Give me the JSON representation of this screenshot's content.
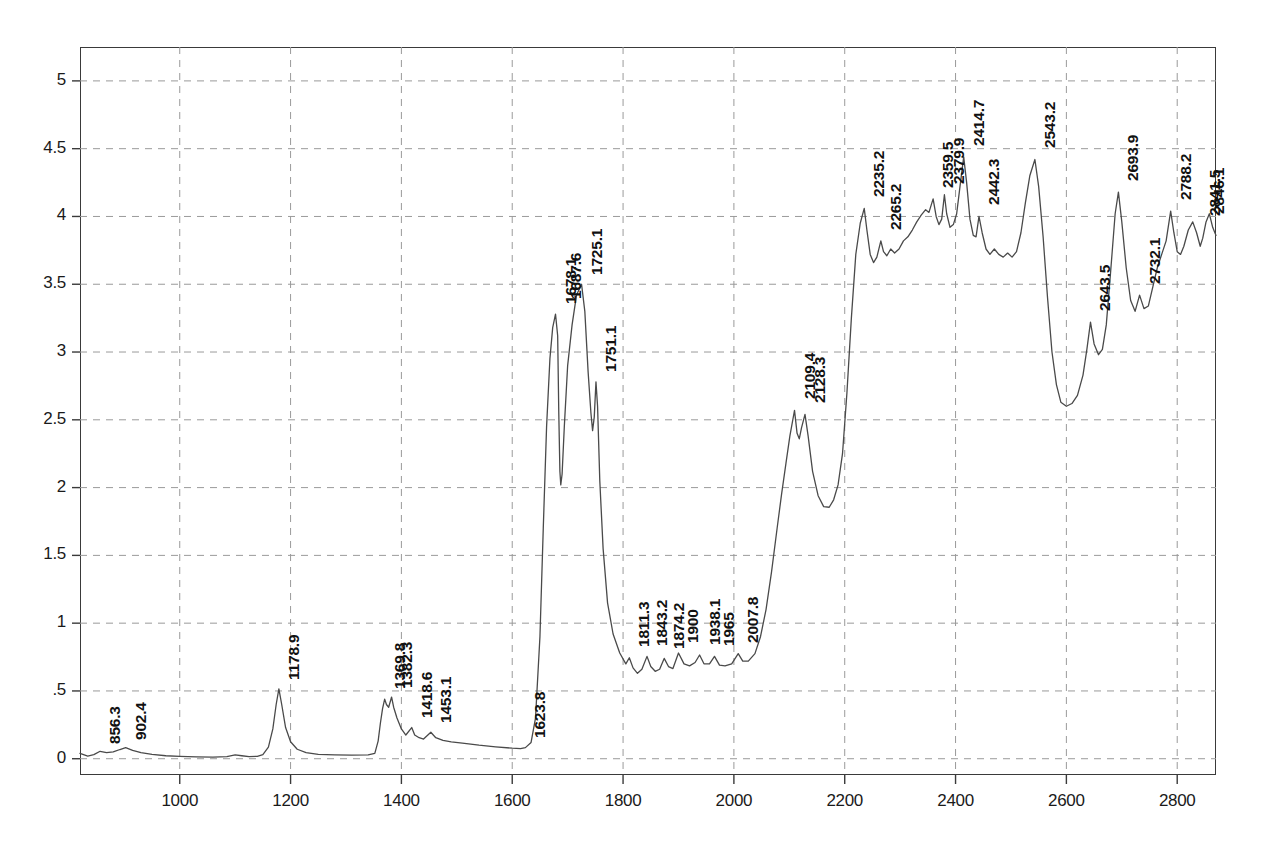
{
  "chart_data": {
    "type": "line",
    "title": "",
    "xlabel": "",
    "ylabel": "",
    "xlim": [
      820,
      2870
    ],
    "ylim": [
      -0.12,
      5.25
    ],
    "grid": true,
    "legend": "none",
    "x_ticks": [
      1000,
      1200,
      1400,
      1600,
      1800,
      2000,
      2200,
      2400,
      2600,
      2800
    ],
    "y_ticks": [
      "0",
      ".5",
      "1",
      "1.5",
      "2",
      "2.5",
      "3",
      "3.5",
      "4",
      "4.5",
      "5"
    ],
    "y_tick_values": [
      0,
      0.5,
      1,
      1.5,
      2,
      2.5,
      3,
      3.5,
      4,
      4.5,
      5
    ],
    "line_color": "#4a4a4a",
    "grid_color": "#9a9a9a",
    "axis_color": "#3a3a3a",
    "series": [
      {
        "name": "spectrum",
        "points": [
          [
            820,
            0.04
          ],
          [
            834,
            0.02
          ],
          [
            845,
            0.03
          ],
          [
            856.3,
            0.055
          ],
          [
            868,
            0.045
          ],
          [
            880,
            0.05
          ],
          [
            892,
            0.068
          ],
          [
            902.4,
            0.082
          ],
          [
            915,
            0.062
          ],
          [
            930,
            0.045
          ],
          [
            950,
            0.032
          ],
          [
            975,
            0.022
          ],
          [
            1000,
            0.018
          ],
          [
            1030,
            0.014
          ],
          [
            1060,
            0.012
          ],
          [
            1085,
            0.016
          ],
          [
            1100,
            0.028
          ],
          [
            1112,
            0.022
          ],
          [
            1125,
            0.016
          ],
          [
            1140,
            0.018
          ],
          [
            1150,
            0.03
          ],
          [
            1160,
            0.085
          ],
          [
            1168,
            0.22
          ],
          [
            1174,
            0.4
          ],
          [
            1178.9,
            0.515
          ],
          [
            1184,
            0.4
          ],
          [
            1191,
            0.23
          ],
          [
            1200,
            0.125
          ],
          [
            1212,
            0.07
          ],
          [
            1228,
            0.045
          ],
          [
            1250,
            0.032
          ],
          [
            1280,
            0.028
          ],
          [
            1310,
            0.026
          ],
          [
            1340,
            0.028
          ],
          [
            1352,
            0.04
          ],
          [
            1358,
            0.13
          ],
          [
            1362,
            0.26
          ],
          [
            1366,
            0.37
          ],
          [
            1369.8,
            0.44
          ],
          [
            1373,
            0.4
          ],
          [
            1377,
            0.38
          ],
          [
            1382.3,
            0.455
          ],
          [
            1386,
            0.38
          ],
          [
            1392,
            0.3
          ],
          [
            1400,
            0.22
          ],
          [
            1408,
            0.175
          ],
          [
            1418.6,
            0.23
          ],
          [
            1424,
            0.175
          ],
          [
            1432,
            0.155
          ],
          [
            1440,
            0.145
          ],
          [
            1453.1,
            0.195
          ],
          [
            1462,
            0.155
          ],
          [
            1475,
            0.135
          ],
          [
            1490,
            0.125
          ],
          [
            1510,
            0.115
          ],
          [
            1540,
            0.1
          ],
          [
            1570,
            0.088
          ],
          [
            1600,
            0.078
          ],
          [
            1615,
            0.075
          ],
          [
            1623.8,
            0.082
          ],
          [
            1634,
            0.12
          ],
          [
            1642,
            0.3
          ],
          [
            1650,
            0.9
          ],
          [
            1656,
            1.7
          ],
          [
            1662,
            2.45
          ],
          [
            1668,
            2.95
          ],
          [
            1673,
            3.18
          ],
          [
            1678.1,
            3.28
          ],
          [
            1682,
            3.12
          ],
          [
            1684,
            2.55
          ],
          [
            1686,
            2.12
          ],
          [
            1687.6,
            2.02
          ],
          [
            1690,
            2.1
          ],
          [
            1694,
            2.45
          ],
          [
            1700,
            2.9
          ],
          [
            1708,
            3.2
          ],
          [
            1716,
            3.42
          ],
          [
            1725.1,
            3.5
          ],
          [
            1731,
            3.3
          ],
          [
            1737,
            2.85
          ],
          [
            1742,
            2.55
          ],
          [
            1745,
            2.42
          ],
          [
            1748,
            2.52
          ],
          [
            1751.1,
            2.78
          ],
          [
            1754,
            2.6
          ],
          [
            1758,
            2.05
          ],
          [
            1764,
            1.55
          ],
          [
            1772,
            1.15
          ],
          [
            1782,
            0.92
          ],
          [
            1794,
            0.78
          ],
          [
            1805,
            0.7
          ],
          [
            1811.3,
            0.745
          ],
          [
            1818,
            0.67
          ],
          [
            1826,
            0.63
          ],
          [
            1834,
            0.66
          ],
          [
            1843.2,
            0.755
          ],
          [
            1850,
            0.68
          ],
          [
            1858,
            0.645
          ],
          [
            1866,
            0.66
          ],
          [
            1874.2,
            0.74
          ],
          [
            1882,
            0.68
          ],
          [
            1890,
            0.665
          ],
          [
            1900,
            0.78
          ],
          [
            1910,
            0.7
          ],
          [
            1920,
            0.685
          ],
          [
            1930,
            0.71
          ],
          [
            1938.1,
            0.765
          ],
          [
            1946,
            0.7
          ],
          [
            1956,
            0.7
          ],
          [
            1965,
            0.755
          ],
          [
            1974,
            0.69
          ],
          [
            1984,
            0.685
          ],
          [
            1996,
            0.7
          ],
          [
            2007.8,
            0.775
          ],
          [
            2016,
            0.72
          ],
          [
            2026,
            0.72
          ],
          [
            2038,
            0.775
          ],
          [
            2048,
            0.9
          ],
          [
            2058,
            1.1
          ],
          [
            2068,
            1.38
          ],
          [
            2078,
            1.7
          ],
          [
            2086,
            1.95
          ],
          [
            2094,
            2.18
          ],
          [
            2101,
            2.38
          ],
          [
            2109.4,
            2.57
          ],
          [
            2114,
            2.4
          ],
          [
            2118,
            2.36
          ],
          [
            2122,
            2.44
          ],
          [
            2128.3,
            2.54
          ],
          [
            2134,
            2.38
          ],
          [
            2142,
            2.12
          ],
          [
            2152,
            1.94
          ],
          [
            2162,
            1.86
          ],
          [
            2172,
            1.855
          ],
          [
            2180,
            1.91
          ],
          [
            2188,
            2.02
          ],
          [
            2196,
            2.25
          ],
          [
            2204,
            2.7
          ],
          [
            2212,
            3.25
          ],
          [
            2220,
            3.72
          ],
          [
            2228,
            3.95
          ],
          [
            2235.2,
            4.06
          ],
          [
            2240,
            3.9
          ],
          [
            2246,
            3.72
          ],
          [
            2252,
            3.66
          ],
          [
            2258,
            3.7
          ],
          [
            2265.2,
            3.82
          ],
          [
            2270,
            3.74
          ],
          [
            2276,
            3.71
          ],
          [
            2283,
            3.76
          ],
          [
            2290,
            3.73
          ],
          [
            2298,
            3.76
          ],
          [
            2306,
            3.82
          ],
          [
            2314,
            3.85
          ],
          [
            2322,
            3.9
          ],
          [
            2330,
            3.96
          ],
          [
            2338,
            4.01
          ],
          [
            2346,
            4.05
          ],
          [
            2352,
            4.03
          ],
          [
            2359.5,
            4.13
          ],
          [
            2365,
            4.0
          ],
          [
            2370,
            3.94
          ],
          [
            2375,
            3.98
          ],
          [
            2379.9,
            4.16
          ],
          [
            2384,
            4.02
          ],
          [
            2390,
            3.92
          ],
          [
            2396,
            3.94
          ],
          [
            2402,
            4.02
          ],
          [
            2408,
            4.22
          ],
          [
            2414.7,
            4.44
          ],
          [
            2420,
            4.25
          ],
          [
            2426,
            3.98
          ],
          [
            2432,
            3.86
          ],
          [
            2437,
            3.85
          ],
          [
            2442.3,
            4.0
          ],
          [
            2448,
            3.88
          ],
          [
            2455,
            3.76
          ],
          [
            2462,
            3.72
          ],
          [
            2470,
            3.76
          ],
          [
            2478,
            3.72
          ],
          [
            2486,
            3.7
          ],
          [
            2494,
            3.73
          ],
          [
            2502,
            3.7
          ],
          [
            2510,
            3.74
          ],
          [
            2518,
            3.88
          ],
          [
            2526,
            4.1
          ],
          [
            2534,
            4.3
          ],
          [
            2543.2,
            4.42
          ],
          [
            2550,
            4.22
          ],
          [
            2558,
            3.85
          ],
          [
            2566,
            3.4
          ],
          [
            2574,
            3.0
          ],
          [
            2582,
            2.76
          ],
          [
            2590,
            2.63
          ],
          [
            2600,
            2.6
          ],
          [
            2610,
            2.62
          ],
          [
            2620,
            2.68
          ],
          [
            2630,
            2.83
          ],
          [
            2637,
            3.02
          ],
          [
            2643.5,
            3.22
          ],
          [
            2650,
            3.06
          ],
          [
            2658,
            2.98
          ],
          [
            2665,
            3.02
          ],
          [
            2672,
            3.2
          ],
          [
            2680,
            3.6
          ],
          [
            2688,
            4.02
          ],
          [
            2693.9,
            4.18
          ],
          [
            2700,
            3.96
          ],
          [
            2708,
            3.62
          ],
          [
            2716,
            3.38
          ],
          [
            2724,
            3.3
          ],
          [
            2732.1,
            3.42
          ],
          [
            2740,
            3.32
          ],
          [
            2748,
            3.34
          ],
          [
            2756,
            3.48
          ],
          [
            2764,
            3.62
          ],
          [
            2772,
            3.72
          ],
          [
            2780,
            3.82
          ],
          [
            2788.2,
            4.04
          ],
          [
            2794,
            3.88
          ],
          [
            2800,
            3.74
          ],
          [
            2806,
            3.72
          ],
          [
            2812,
            3.78
          ],
          [
            2820,
            3.9
          ],
          [
            2828,
            3.96
          ],
          [
            2835,
            3.88
          ],
          [
            2841.5,
            3.78
          ],
          [
            2846.1,
            3.84
          ],
          [
            2852,
            3.96
          ],
          [
            2858,
            4.02
          ],
          [
            2864,
            3.92
          ],
          [
            2870,
            3.86
          ]
        ]
      }
    ],
    "peak_labels": [
      {
        "text": "856.3",
        "x": 856.3,
        "y": 0.06
      },
      {
        "text": "902.4",
        "x": 902.4,
        "y": 0.09
      },
      {
        "text": "1178.9",
        "x": 1178.9,
        "y": 0.53
      },
      {
        "text": "1369.8",
        "x": 1369.8,
        "y": 0.46
      },
      {
        "text": "1382.3",
        "x": 1382.3,
        "y": 0.47
      },
      {
        "text": "1418.6",
        "x": 1418.6,
        "y": 0.25
      },
      {
        "text": "1453.1",
        "x": 1453.1,
        "y": 0.21
      },
      {
        "text": "1623.8",
        "x": 1623.8,
        "y": 0.1
      },
      {
        "text": "1678.1",
        "x": 1678.1,
        "y": 3.3
      },
      {
        "text": "1687.6",
        "x": 1687.6,
        "y": 3.34
      },
      {
        "text": "1725.1",
        "x": 1725.1,
        "y": 3.52
      },
      {
        "text": "1751.1",
        "x": 1751.1,
        "y": 2.8
      },
      {
        "text": "1811.3",
        "x": 1811.3,
        "y": 0.77
      },
      {
        "text": "1843.2",
        "x": 1843.2,
        "y": 0.78
      },
      {
        "text": "1874.2",
        "x": 1874.2,
        "y": 0.76
      },
      {
        "text": "1900",
        "x": 1900,
        "y": 0.8
      },
      {
        "text": "1938.1",
        "x": 1938.1,
        "y": 0.79
      },
      {
        "text": "1965",
        "x": 1965,
        "y": 0.78
      },
      {
        "text": "2007.8",
        "x": 2007.8,
        "y": 0.8
      },
      {
        "text": "2109.4",
        "x": 2109.4,
        "y": 2.6
      },
      {
        "text": "2128.3",
        "x": 2128.3,
        "y": 2.57
      },
      {
        "text": "2235.2",
        "x": 2235.2,
        "y": 4.09
      },
      {
        "text": "2265.2",
        "x": 2265.2,
        "y": 3.85
      },
      {
        "text": "2359.5",
        "x": 2359.5,
        "y": 4.16
      },
      {
        "text": "2379.9",
        "x": 2379.9,
        "y": 4.19
      },
      {
        "text": "2414.7",
        "x": 2414.7,
        "y": 4.47
      },
      {
        "text": "2442.3",
        "x": 2442.3,
        "y": 4.03
      },
      {
        "text": "2543.2",
        "x": 2543.2,
        "y": 4.45
      },
      {
        "text": "2643.5",
        "x": 2643.5,
        "y": 3.25
      },
      {
        "text": "2693.9",
        "x": 2693.9,
        "y": 4.21
      },
      {
        "text": "2732.1",
        "x": 2732.1,
        "y": 3.45
      },
      {
        "text": "2788.2",
        "x": 2788.2,
        "y": 4.07
      },
      {
        "text": "2841.5",
        "x": 2841.5,
        "y": 3.95
      },
      {
        "text": "2846.1",
        "x": 2848.0,
        "y": 3.97
      }
    ]
  }
}
